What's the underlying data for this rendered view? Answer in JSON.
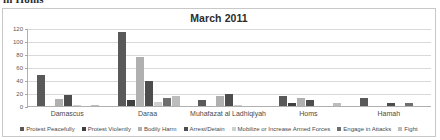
{
  "page": {
    "bleed_text_above": "in Homs"
  },
  "chart_data": {
    "type": "bar",
    "title": "March 2011",
    "xlabel": "",
    "ylabel": "",
    "ylim": [
      0,
      120
    ],
    "yticks": [
      0,
      20,
      40,
      60,
      80,
      100,
      120
    ],
    "grid": true,
    "legend_position": "bottom",
    "categories": [
      "Damascus",
      "Daraa",
      "Muhafazat al Ladhiqiyah",
      "Homs",
      "Hamah"
    ],
    "series": [
      {
        "name": "Protest Peacefully",
        "color": "#595959",
        "values": [
          47,
          114,
          9,
          15,
          13
        ]
      },
      {
        "name": "Protest Violently",
        "color": "#3f3f3f",
        "values": [
          0,
          9,
          0,
          4,
          0
        ]
      },
      {
        "name": "Bodily Harm",
        "color": "#b0b0b0",
        "values": [
          11,
          76,
          15,
          13,
          0
        ]
      },
      {
        "name": "Arrest/Detain",
        "color": "#4d4d4d",
        "values": [
          17,
          38,
          18,
          10,
          5
        ]
      },
      {
        "name": "Mobilize or Increase Armed Forces",
        "color": "#d0d0d0",
        "values": [
          2,
          6,
          2,
          0,
          0
        ]
      },
      {
        "name": "Engage in Attacks",
        "color": "#6e6e6e",
        "values": [
          0,
          12,
          0,
          0,
          5
        ]
      },
      {
        "name": "Fight",
        "color": "#bdbdbd",
        "values": [
          2,
          16,
          0,
          4,
          0
        ]
      }
    ]
  }
}
